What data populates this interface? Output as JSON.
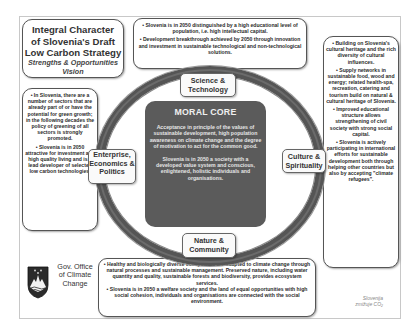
{
  "title": {
    "line1": "Integral Character",
    "line2": "of Slovenia's Draft",
    "line3": "Low Carbon Strategy",
    "subtitle1": "Strengths & Opportunities",
    "subtitle2": "Vision"
  },
  "boxes": {
    "top": [
      "• Slovenia is in 2050 distinguished by a high educational level of population, i.e. high intellectual capital.",
      "• Development breakthrough achieved by 2050 through innovation and investment in sustainable technological and non-technological solutions."
    ],
    "left": [
      "• In Slovenia, there are a number of sectors that are already part of or have the potential for green growth; in the following decades the policy of greening of all sectors is strongly promoted.",
      "• Slovenia is in 2050 attractive for investment and high quality living and is a lead developer of selected low carbon technologies."
    ],
    "right": [
      "• Building on Slovenia's cultural heritage and the rich diversity of cultural influences.",
      "• Supply networks in sustainable food, wood and energy; related health-spa, recreation, catering and tourism build on natural & cultural heritage of Slovenia.",
      "• Improved educational structure allows strengthening of civil society with strong social capital.",
      "• Slovenia is actively participating in international efforts for sustainable development both through helping other countries but also by accepting \"climate refugees\"."
    ],
    "bottom": [
      "• Healthy and biologically diverse ecosystems are adapted to climate change through natural processes and sustainable management. Preserved nature, including water quantity and quality, sustainable forests and biodiversity, provides ecosystem services.",
      "• Slovenia is in 2050 a welfare society and the land of equal opportunities with high social cohesion, individuals and organisations are connected with the social environment."
    ]
  },
  "core": {
    "title": "MORAL CORE",
    "text1": "Acceptance in principle of the values of sustainable development, high population awareness on climate change and the degree of motivation to act for the common good.",
    "text2": "Slovenia is in 2050 a society with a developed value system and conscious, enlightened, holistic individuals and organisations."
  },
  "labels": {
    "science": "Science & Technology",
    "enterprise": "Enterprise, Economics & Politics",
    "culture": "Culture & Spirituality",
    "nature": "Nature & Community"
  },
  "footer": {
    "office": "Gov. Office of Climate Change",
    "slogan": "Slovenija zmižuje CO₂"
  },
  "colors": {
    "core_bg": "#5b5b5b",
    "ring": "#555555",
    "box_border": "#555555",
    "text": "#2a2a2a"
  }
}
